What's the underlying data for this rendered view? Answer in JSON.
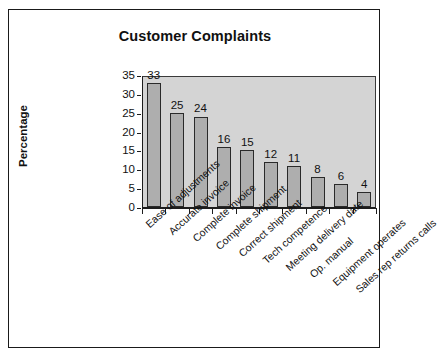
{
  "chart_data": {
    "type": "bar",
    "title": "Customer Complaints",
    "xlabel": "",
    "ylabel": "Percentage",
    "ylim": [
      0,
      35
    ],
    "ytick_step": 5,
    "yticks": [
      "35",
      "30",
      "25",
      "20",
      "15",
      "10",
      "5",
      "0"
    ],
    "grid": false,
    "legend": false,
    "legend_position": "none",
    "bar_orientation": "vertical",
    "data_labels_shown": true,
    "categories": [
      "Ease of adjustments",
      "Accurate invoice",
      "Complete invoice",
      "Complete shipment",
      "Correct shipment",
      "Tech competence",
      "Meeting delivery date",
      "Op. manual",
      "Equipment operates",
      "Sales rep returns calls"
    ],
    "values": [
      33,
      25,
      24,
      16,
      15,
      12,
      11,
      8,
      6,
      4
    ],
    "value_labels": [
      "33",
      "25",
      "24",
      "16",
      "15",
      "12",
      "11",
      "8",
      "6",
      "4"
    ]
  },
  "style": {
    "plot_background": "#d4d4d4",
    "bar_fill": "#aeaeae",
    "bar_border": "#2a2a2a",
    "axis_color": "#1d1d1d",
    "text_color": "#111111",
    "frame_color": "#1a1a1a",
    "page_background": "#ffffff"
  }
}
